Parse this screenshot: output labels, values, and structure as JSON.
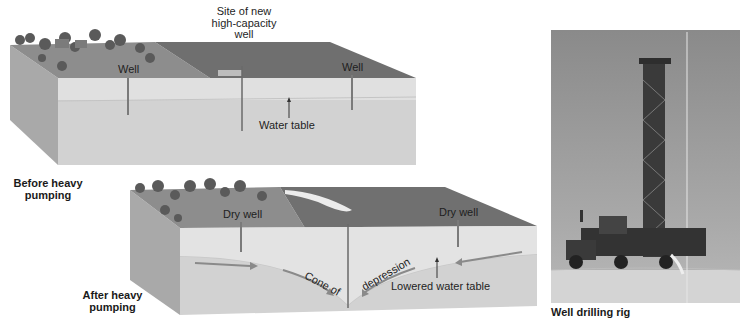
{
  "figure": {
    "panels": [
      {
        "id": "before",
        "caption": "Before heavy pumping",
        "caption_lines": [
          "Before heavy",
          "pumping"
        ],
        "labels": {
          "site_new_well": [
            "Site of new",
            "high-capacity",
            "well"
          ],
          "well_left": "Well",
          "well_right": "Well",
          "water_table": "Water table"
        }
      },
      {
        "id": "after",
        "caption": "After heavy pumping",
        "caption_lines": [
          "After heavy",
          "pumping"
        ],
        "labels": {
          "dry_well_left": "Dry well",
          "dry_well_right": "Dry well",
          "cone_left": "Cone of",
          "cone_right": "depression",
          "lowered_water_table": "Lowered water table"
        }
      },
      {
        "id": "photo",
        "caption": "Well drilling rig"
      }
    ],
    "colors": {
      "background": "#ffffff",
      "top_face_dark": "#6e6e6e",
      "top_face_land": "#8c8c8c",
      "front_upper": "#dcdcdc",
      "front_lower": "#cfcfcf",
      "side_face": "#a8a8a8",
      "well_pipe": "#7a7a7a",
      "flow_arrow": "#8a8a8a"
    }
  }
}
